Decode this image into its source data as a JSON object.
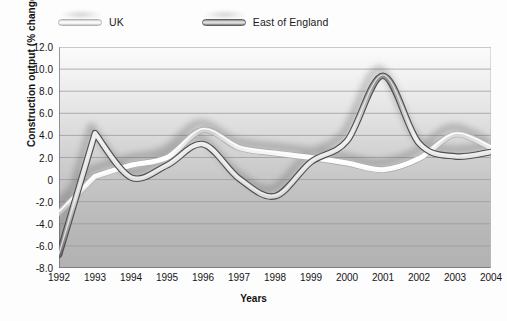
{
  "chart_data": {
    "type": "line",
    "title": "",
    "xlabel": "Years",
    "ylabel": "Construction output (% change)",
    "x": [
      1992,
      1993,
      1994,
      1995,
      1996,
      1997,
      1998,
      1999,
      2000,
      2001,
      2002,
      2003,
      2004
    ],
    "categories": [
      "1992",
      "1993",
      "1994",
      "1995",
      "1996",
      "1997",
      "1998",
      "1999",
      "2000",
      "2001",
      "2002",
      "2003",
      "2004"
    ],
    "xlim": [
      1992,
      2004
    ],
    "ylim": [
      -8.0,
      12.0
    ],
    "yticks": [
      "12.0",
      "10.0",
      "8.0",
      "6.0",
      "4.0",
      "2.0",
      "0",
      "-2.0",
      "-4.0",
      "-6.0",
      "-8.0"
    ],
    "ytick_values": [
      12.0,
      10.0,
      8.0,
      6.0,
      4.0,
      2.0,
      0,
      -2.0,
      -4.0,
      -6.0,
      -8.0
    ],
    "grid": true,
    "legend_position": "above-plot-left",
    "series": [
      {
        "name": "UK",
        "color": "#f0f0f0",
        "edge_color": "#b4b4b4",
        "values": [
          -3.0,
          0.3,
          1.3,
          2.0,
          4.5,
          2.9,
          2.4,
          2.0,
          1.5,
          0.9,
          1.9,
          4.1,
          2.9
        ]
      },
      {
        "name": "East of England",
        "color": "#d6d6d6",
        "edge_color": "#5f5f5f",
        "values": [
          -6.8,
          4.2,
          0.2,
          1.3,
          3.2,
          0.1,
          -1.5,
          1.6,
          3.5,
          9.4,
          3.3,
          2.1,
          2.5
        ]
      }
    ]
  },
  "legend": {
    "items": [
      {
        "label": "UK",
        "swatch": "uk-line-swatch"
      },
      {
        "label": "East of England",
        "swatch": "east-of-england-line-swatch"
      }
    ]
  },
  "axes": {
    "y_title": "Construction output (% change)",
    "x_title": "Years"
  },
  "colors": {
    "uk_line": "#f0f0f0",
    "uk_edge": "#b4b4b4",
    "eoe_line": "#d6d6d6",
    "eoe_edge": "#5f5f5f",
    "grid": "#9a9a9a",
    "axis": "#6f6f6f",
    "text": "#151515"
  }
}
